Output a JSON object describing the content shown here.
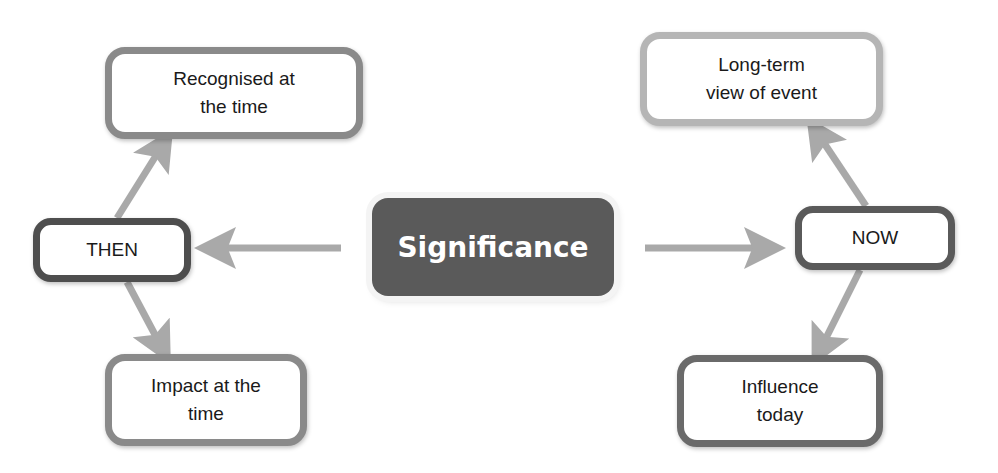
{
  "diagram": {
    "center": {
      "label": "Significance"
    },
    "then": {
      "label": "THEN"
    },
    "now": {
      "label": "NOW"
    },
    "recognised": {
      "line1": "Recognised at",
      "line2": "the time"
    },
    "impact": {
      "line1": "Impact at the",
      "line2": "time"
    },
    "longterm": {
      "line1": "Long-term",
      "line2": "view of event"
    },
    "influence": {
      "line1": "Influence",
      "line2": "today"
    },
    "colors": {
      "arrow": "#a9a9a9",
      "center_fill": "#5a5a5a"
    }
  }
}
